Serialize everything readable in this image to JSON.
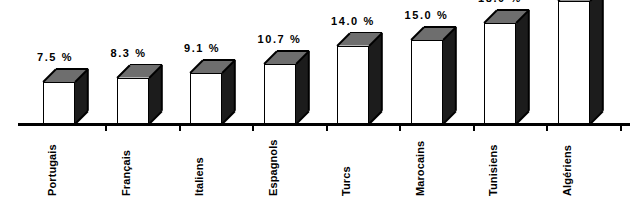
{
  "chart_data": {
    "type": "bar",
    "title": "",
    "subtitle": "",
    "xlabel": "",
    "ylabel": "",
    "grid": false,
    "legend": null,
    "style": "3d-isometric-bars",
    "ylim": [
      0,
      24
    ],
    "categories": [
      "Portugais",
      "Français",
      "Italiens",
      "Espagnols",
      "Turcs",
      "Marocains",
      "Tunisiens",
      "Algériens"
    ],
    "values": [
      7.5,
      8.3,
      9.1,
      10.7,
      14.0,
      15.0,
      18.0,
      22.0
    ],
    "value_labels": [
      "7.5 %",
      "8.3 %",
      "9.1 %",
      "10.7 %",
      "14.0 %",
      "15.0 %",
      "18.0 %",
      "22.0"
    ],
    "colors": {
      "bar_front": "#ffffff",
      "bar_top": "#6e6e6e",
      "bar_side": "#1c1c1c",
      "outline": "#000000",
      "axis": "#000000",
      "text": "#000000",
      "background": "#ffffff"
    }
  }
}
